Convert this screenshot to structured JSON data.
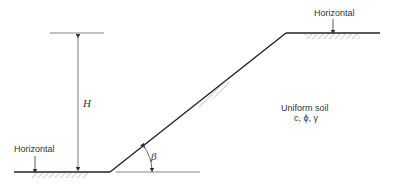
{
  "diagram": {
    "type": "slope-cross-section",
    "labels": {
      "top_surface": "Horizontal",
      "bottom_surface": "Horizontal",
      "height": "H",
      "angle": "β",
      "soil_title": "Uniform soil",
      "soil_params": "c, ϕ, γ"
    },
    "geometry": {
      "toe": [
        110,
        172
      ],
      "crest": [
        286,
        33
      ],
      "bottom_ground": [
        [
          14,
          172
        ],
        [
          110,
          172
        ]
      ],
      "top_ground": [
        [
          286,
          33
        ],
        [
          380,
          33
        ]
      ],
      "height_ref_line": [
        [
          50,
          33
        ],
        [
          104,
          33
        ]
      ],
      "height_arrow_x": 78,
      "angle_baseline": [
        [
          116,
          172
        ],
        [
          200,
          172
        ]
      ]
    },
    "colors": {
      "line": "#222222",
      "thin_line": "#666666",
      "hatch": "#888888",
      "text": "#333333"
    }
  }
}
